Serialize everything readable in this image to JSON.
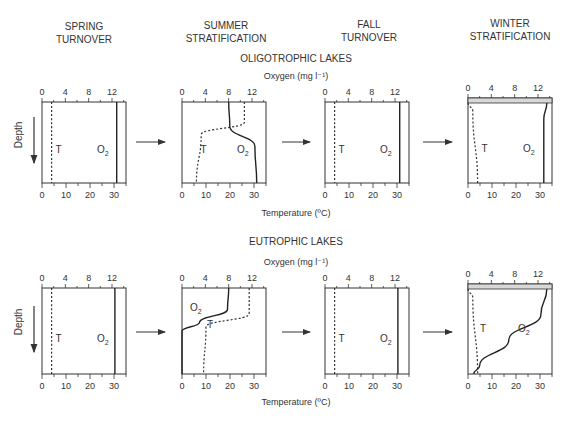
{
  "season_headers": [
    {
      "line1": "SPRING",
      "line2": "TURNOVER",
      "cx": 84
    },
    {
      "line1": "SUMMER",
      "line2": "STRATIFICATION",
      "cx": 226
    },
    {
      "line1": "FALL",
      "line2": "TURNOVER",
      "cx": 369
    },
    {
      "line1": "WINTER",
      "line2": "STRATIFICATION",
      "cx": 510
    }
  ],
  "rows": [
    {
      "id": "oligotrophic",
      "title": "OLIGOTROPHIC LAKES",
      "title_y": 62,
      "oxygen_label": "Oxygen (mg l⁻¹)",
      "oxygen_label_y": 79,
      "top": 102,
      "bottom": 183,
      "temperature_label": "Temperature (ºC)",
      "temperature_label_y": 216
    },
    {
      "id": "eutrophic",
      "title": "EUTROPHIC LAKES",
      "title_y": 245,
      "oxygen_label": "Oxygen (mg l⁻¹)",
      "oxygen_label_y": 265,
      "top": 288,
      "bottom": 374,
      "temperature_label": "Temperature (ºC)",
      "temperature_label_y": 405
    }
  ],
  "axes": {
    "oxygen_ticks": [
      "0",
      "4",
      "8",
      "12"
    ],
    "temperature_ticks": [
      "0",
      "10",
      "20",
      "30"
    ],
    "depth_label": "Depth",
    "temp_curve_label": "T",
    "oxygen_curve_label": "O",
    "oxygen_subscript": "2"
  },
  "panel_x": [
    42,
    182,
    325,
    468
  ],
  "chart_data": {
    "type": "line",
    "xlabel_top": "Oxygen (mg l-1)",
    "xlabel_bottom": "Temperature (ºC)",
    "ylabel": "Depth",
    "x_oxygen_range": [
      0,
      14
    ],
    "x_temperature_range": [
      0,
      35
    ],
    "columns": [
      "Spring turnover",
      "Summer stratification",
      "Fall turnover",
      "Winter stratification"
    ],
    "panels": [
      {
        "row": "Oligotrophic",
        "season": "Spring turnover",
        "T_profile_C": [
          [
            0,
            4
          ],
          [
            1,
            4
          ]
        ],
        "O2_profile_mg": [
          [
            0,
            12.8
          ],
          [
            1,
            12.8
          ]
        ]
      },
      {
        "row": "Oligotrophic",
        "season": "Summer stratification",
        "T_profile_C": [
          [
            0,
            26
          ],
          [
            0.25,
            26
          ],
          [
            0.4,
            8
          ],
          [
            1,
            6
          ]
        ],
        "O2_profile_mg": [
          [
            0,
            8
          ],
          [
            0.3,
            8.2
          ],
          [
            0.55,
            12.5
          ],
          [
            1,
            12.8
          ]
        ]
      },
      {
        "row": "Oligotrophic",
        "season": "Fall turnover",
        "T_profile_C": [
          [
            0,
            4
          ],
          [
            1,
            4
          ]
        ],
        "O2_profile_mg": [
          [
            0,
            12.8
          ],
          [
            1,
            12.8
          ]
        ]
      },
      {
        "row": "Oligotrophic",
        "season": "Winter stratification",
        "T_profile_C": [
          [
            0,
            0
          ],
          [
            0.1,
            2
          ],
          [
            1,
            4
          ]
        ],
        "O2_profile_mg": [
          [
            0,
            13.5
          ],
          [
            0.2,
            13
          ],
          [
            1,
            13
          ]
        ],
        "ice_cover": true
      },
      {
        "row": "Eutrophic",
        "season": "Spring turnover",
        "T_profile_C": [
          [
            0,
            4
          ],
          [
            1,
            4
          ]
        ],
        "O2_profile_mg": [
          [
            0,
            12.5
          ],
          [
            1,
            12.5
          ]
        ]
      },
      {
        "row": "Eutrophic",
        "season": "Summer stratification",
        "T_profile_C": [
          [
            0,
            28
          ],
          [
            0.3,
            28
          ],
          [
            0.45,
            10
          ],
          [
            1,
            9
          ]
        ],
        "O2_profile_mg": [
          [
            0,
            8
          ],
          [
            0.25,
            7.8
          ],
          [
            0.4,
            3
          ],
          [
            0.5,
            0
          ],
          [
            1,
            0
          ]
        ]
      },
      {
        "row": "Eutrophic",
        "season": "Fall turnover",
        "T_profile_C": [
          [
            0,
            4
          ],
          [
            1,
            4
          ]
        ],
        "O2_profile_mg": [
          [
            0,
            12.5
          ],
          [
            1,
            12.5
          ]
        ]
      },
      {
        "row": "Eutrophic",
        "season": "Winter stratification",
        "T_profile_C": [
          [
            0,
            0
          ],
          [
            0.1,
            2
          ],
          [
            1,
            4
          ]
        ],
        "O2_profile_mg": [
          [
            0,
            13.5
          ],
          [
            0.3,
            12.5
          ],
          [
            0.6,
            7
          ],
          [
            0.9,
            2
          ],
          [
            1,
            1
          ]
        ],
        "ice_cover": true
      }
    ]
  }
}
